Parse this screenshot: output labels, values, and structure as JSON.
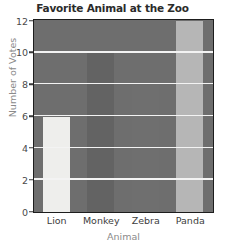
{
  "chart_data": {
    "type": "bar",
    "title": "Favorite Animal at the Zoo",
    "xlabel": "Animal",
    "ylabel": "Number of Votes",
    "categories": [
      "Lion",
      "Monkey",
      "Zebra",
      "Panda"
    ],
    "values": [
      6,
      10,
      8,
      12
    ],
    "ylim": [
      0,
      12
    ],
    "ytick_labels": [
      "0",
      "2",
      "4",
      "6",
      "8",
      "10",
      "12"
    ],
    "ytick_values": [
      0,
      2,
      4,
      6,
      8,
      10,
      12
    ],
    "grid": true,
    "gridlines_at": [
      2,
      4,
      6,
      8,
      10
    ],
    "legend": null,
    "bar_colors": [
      "#eeeeec",
      "#636363",
      "#6f6f6f",
      "#b6b6b6"
    ],
    "plot_background": "#6e6e6e",
    "gridline_color": "#f3f3f3",
    "axis_border_color": "#1d1d1d",
    "title_color": "#2b2b2b",
    "axis_label_color": "#8a8a8a",
    "tick_label_color": "#4a4a4a"
  }
}
